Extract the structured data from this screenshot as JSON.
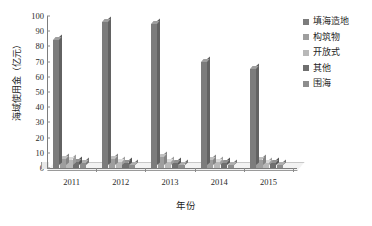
{
  "chart_data": {
    "type": "bar",
    "title": "",
    "xlabel": "年份",
    "ylabel": "海域使用金（亿元）",
    "categories": [
      "2011",
      "2012",
      "2013",
      "2014",
      "2015"
    ],
    "ylim": [
      0,
      100
    ],
    "yticks": [
      "0",
      "10",
      "20",
      "30",
      "40",
      "50",
      "60",
      "70",
      "80",
      "90",
      "100"
    ],
    "grid": false,
    "legend_position": "right",
    "series": [
      {
        "name": "填海造地",
        "color": "#7c7c7c",
        "values": [
          84,
          96,
          95,
          70,
          65
        ]
      },
      {
        "name": "构筑物",
        "color": "#9e9e9e",
        "values": [
          6,
          6,
          7,
          5,
          5
        ]
      },
      {
        "name": "开放式",
        "color": "#b8b8b8",
        "values": [
          5,
          4,
          4,
          4,
          3
        ]
      },
      {
        "name": "其他",
        "color": "#6f6f6f",
        "values": [
          4,
          3,
          3,
          3,
          3
        ]
      },
      {
        "name": "围海",
        "color": "#8d8d8d",
        "values": [
          3,
          2,
          2,
          2,
          2
        ]
      }
    ]
  }
}
